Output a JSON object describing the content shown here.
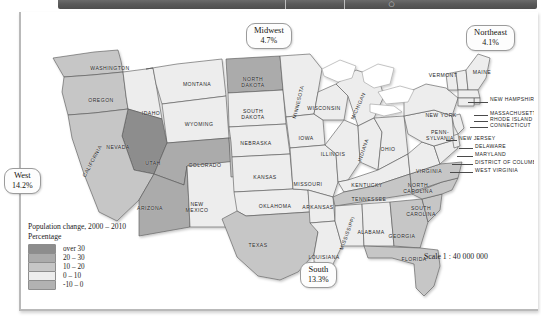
{
  "toolbar": {
    "glyph": "○"
  },
  "legend": {
    "title_line1": "Population change, 2000 – 2010",
    "title_line2": "Percentage",
    "items": [
      {
        "label": "over 30",
        "color": "#8d8d8d"
      },
      {
        "label": "20 – 30",
        "color": "#ababab"
      },
      {
        "label": "10 – 20",
        "color": "#c6c6c6"
      },
      {
        "label": "0 – 10",
        "color": "#ededed"
      },
      {
        "label": "-10 – 0",
        "color": "#b2b2b2"
      }
    ]
  },
  "scale": {
    "text": "Scale 1 : 40 000 000"
  },
  "regions": [
    {
      "id": "west",
      "name": "West",
      "value": "14.2%",
      "x": 4,
      "y": 168
    },
    {
      "id": "midwest",
      "name": "Midwest",
      "value": "4.7%",
      "x": 246,
      "y": 23
    },
    {
      "id": "northeast",
      "name": "Northeast",
      "value": "4.1%",
      "x": 466,
      "y": 25
    },
    {
      "id": "south",
      "name": "South",
      "value": "13.3%",
      "x": 300,
      "y": 262
    }
  ],
  "states": [
    {
      "name": "WASHINGTON",
      "x": 88,
      "y": 54,
      "rot": 0,
      "fill": "#c6c6c6"
    },
    {
      "name": "OREGON",
      "x": 79,
      "y": 86,
      "rot": 0,
      "fill": "#c6c6c6"
    },
    {
      "name": "IDAHO",
      "x": 129,
      "y": 99,
      "rot": 0,
      "fill": "#ededed"
    },
    {
      "name": "MONTANA",
      "x": 175,
      "y": 70,
      "rot": 0,
      "fill": "#ededed"
    },
    {
      "name": "WYOMING",
      "x": 177,
      "y": 110,
      "rot": 0,
      "fill": "#ededed"
    },
    {
      "name": "NEVADA",
      "x": 96,
      "y": 133,
      "rot": 0,
      "fill": "#8d8d8d"
    },
    {
      "name": "CALIFORNIA",
      "x": 70,
      "y": 147,
      "rot": -62,
      "fill": "#c6c6c6"
    },
    {
      "name": "UTAH",
      "x": 131,
      "y": 149,
      "rot": 0,
      "fill": "#ababab"
    },
    {
      "name": "ARIZONA",
      "x": 128,
      "y": 194,
      "rot": 0,
      "fill": "#ababab"
    },
    {
      "name": "NEW\nMEXICO",
      "x": 175,
      "y": 193,
      "rot": 0,
      "fill": "#ededed"
    },
    {
      "name": "COLORADO",
      "x": 183,
      "y": 151,
      "rot": 0,
      "fill": "#c6c6c6"
    },
    {
      "name": "NORTH\nDAKOTA",
      "x": 231,
      "y": 68,
      "rot": 0,
      "fill": "#ababab"
    },
    {
      "name": "SOUTH\nDAKOTA",
      "x": 231,
      "y": 100,
      "rot": 0,
      "fill": "#ededed"
    },
    {
      "name": "NEBRASKA",
      "x": 234,
      "y": 129,
      "rot": 0,
      "fill": "#ededed"
    },
    {
      "name": "KANSAS",
      "x": 243,
      "y": 163,
      "rot": 0,
      "fill": "#ededed"
    },
    {
      "name": "OKLAHOMA",
      "x": 253,
      "y": 192,
      "rot": 0,
      "fill": "#ededed"
    },
    {
      "name": "TEXAS",
      "x": 236,
      "y": 231,
      "rot": 0,
      "fill": "#c6c6c6"
    },
    {
      "name": "MINNESOTA",
      "x": 276,
      "y": 88,
      "rot": -76,
      "fill": "#ededed"
    },
    {
      "name": "IOWA",
      "x": 284,
      "y": 124,
      "rot": 0,
      "fill": "#ededed"
    },
    {
      "name": "MISSOURI",
      "x": 286,
      "y": 170,
      "rot": 0,
      "fill": "#ededed"
    },
    {
      "name": "ARKANSAS",
      "x": 296,
      "y": 193,
      "rot": 0,
      "fill": "#ededed"
    },
    {
      "name": "LOUISIANA",
      "x": 302,
      "y": 243,
      "rot": 0,
      "fill": "#ededed"
    },
    {
      "name": "WISCONSIN",
      "x": 302,
      "y": 94,
      "rot": 0,
      "fill": "#ededed"
    },
    {
      "name": "ILLINOIS",
      "x": 311,
      "y": 140,
      "rot": 0,
      "fill": "#ededed"
    },
    {
      "name": "MICHIGAN",
      "x": 336,
      "y": 92,
      "rot": -66,
      "fill": "#ededed"
    },
    {
      "name": "INDIANA",
      "x": 341,
      "y": 136,
      "rot": -72,
      "fill": "#ededed"
    },
    {
      "name": "OHIO",
      "x": 366,
      "y": 135,
      "rot": 0,
      "fill": "#ededed"
    },
    {
      "name": "KENTUCKY",
      "x": 345,
      "y": 171,
      "rot": 0,
      "fill": "#ededed"
    },
    {
      "name": "TENNESSEE",
      "x": 347,
      "y": 185,
      "rot": 0,
      "fill": "#c6c6c6"
    },
    {
      "name": "MISSISSIPPI",
      "x": 325,
      "y": 219,
      "rot": -70,
      "fill": "#ededed"
    },
    {
      "name": "ALABAMA",
      "x": 349,
      "y": 218,
      "rot": 0,
      "fill": "#ededed"
    },
    {
      "name": "GEORGIA",
      "x": 380,
      "y": 222,
      "rot": 0,
      "fill": "#c6c6c6"
    },
    {
      "name": "FLORIDA",
      "x": 392,
      "y": 245,
      "rot": 0,
      "fill": "#c6c6c6"
    },
    {
      "name": "SOUTH\nCAROLINA",
      "x": 399,
      "y": 197,
      "rot": 0,
      "fill": "#c6c6c6"
    },
    {
      "name": "NORTH\nCAROLINA",
      "x": 396,
      "y": 174,
      "rot": 0,
      "fill": "#c6c6c6"
    },
    {
      "name": "VIRGINIA",
      "x": 407,
      "y": 157,
      "rot": 0,
      "fill": "#c6c6c6"
    },
    {
      "name": "NEW YORK",
      "x": 419,
      "y": 101,
      "rot": 0,
      "fill": "#ededed"
    },
    {
      "name": "PENN-\nSYLVANIA",
      "x": 418,
      "y": 121,
      "rot": 0,
      "fill": "#ededed"
    },
    {
      "name": "VERMONT",
      "x": 421,
      "y": 61,
      "rot": 0,
      "fill": "#ededed"
    },
    {
      "name": "MAINE",
      "x": 460,
      "y": 58,
      "rot": 0,
      "fill": "#ededed"
    }
  ],
  "leader_labels": [
    {
      "name": "NEW HAMPSHIRE",
      "x": 468,
      "y": 85
    },
    {
      "name": "MASSACHUSETTS",
      "x": 468,
      "y": 99
    },
    {
      "name": "RHODE ISLAND",
      "x": 468,
      "y": 105
    },
    {
      "name": "CONNECTICUT",
      "x": 468,
      "y": 111
    },
    {
      "name": "NEW JERSEY",
      "x": 437,
      "y": 124
    },
    {
      "name": "DELAWARE",
      "x": 453,
      "y": 132
    },
    {
      "name": "MARYLAND",
      "x": 453,
      "y": 140
    },
    {
      "name": "DISTRICT OF COLUMBIA",
      "x": 453,
      "y": 148
    },
    {
      "name": "WEST VIRGINIA",
      "x": 453,
      "y": 156
    }
  ]
}
